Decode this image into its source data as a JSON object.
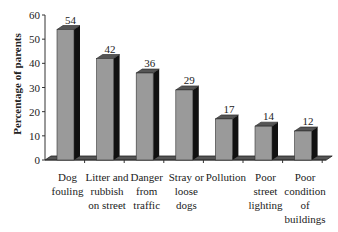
{
  "chart_data": {
    "type": "bar",
    "title": "",
    "xlabel": "",
    "ylabel": "Percentage of parents",
    "ylim": [
      0,
      60
    ],
    "yticks": [
      0,
      10,
      20,
      30,
      40,
      50,
      60
    ],
    "grid": false,
    "legend": null,
    "style": "3d",
    "categories": [
      "Dog fouling",
      "Litter and rubbish on street",
      "Danger from traffic",
      "Stray or loose dogs",
      "Pollution",
      "Poor street lighting",
      "Poor condition of buildings"
    ],
    "category_lines": [
      [
        "Dog",
        "fouling"
      ],
      [
        "Litter and",
        "rubbish",
        "on street"
      ],
      [
        "Danger",
        "from",
        "traffic"
      ],
      [
        "Stray or",
        "loose",
        "dogs"
      ],
      [
        "Pollution"
      ],
      [
        "Poor",
        "street",
        "lighting"
      ],
      [
        "Poor",
        "condition",
        "of",
        "buildings"
      ]
    ],
    "values": [
      54,
      42,
      36,
      29,
      17,
      14,
      12
    ],
    "data_labels": [
      "54",
      "42",
      "36",
      "29",
      "17",
      "14",
      "12"
    ],
    "colors": {
      "bar_front": "#9a9a9a",
      "bar_side": "#111111",
      "bar_top": "#555555",
      "axis": "#333333"
    }
  }
}
